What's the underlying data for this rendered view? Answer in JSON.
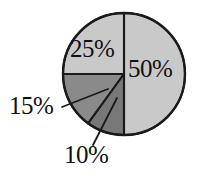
{
  "figure": {
    "background_color": "#ffffff",
    "width": 200,
    "height": 181
  },
  "chart_data": {
    "type": "pie",
    "title": "",
    "subtitle": "",
    "xlabel": "",
    "ylabel": "",
    "legend": "none",
    "grid": false,
    "start_angle_deg": 0,
    "direction": "clockwise",
    "center": {
      "x": 124,
      "y": 74
    },
    "radius": 61,
    "labels": [
      "50%",
      "25%",
      "15%",
      "10%"
    ],
    "values": [
      50,
      25,
      15,
      10
    ],
    "categories": [
      "50%",
      "25%",
      "15%",
      "10%"
    ],
    "slices": [
      {
        "label": "50%",
        "value": 50,
        "start_angle_deg": 0,
        "end_angle_deg": 180,
        "color": "#c9c9c9",
        "edge_color": "#1a1a1a",
        "label_position": "inside"
      },
      {
        "label": "25%",
        "value": 25,
        "start_angle_deg": 270,
        "end_angle_deg": 360,
        "color": "#c9c9c9",
        "edge_color": "#1a1a1a",
        "label_position": "inside"
      },
      {
        "label": "15%",
        "value": 15,
        "start_angle_deg": 216,
        "end_angle_deg": 270,
        "color": "#8a8a8a",
        "edge_color": "#1a1a1a",
        "label_position": "outside-left",
        "leader_line": true
      },
      {
        "label": "10%",
        "value": 10,
        "start_angle_deg": 180,
        "end_angle_deg": 216,
        "color": "#787878",
        "edge_color": "#1a1a1a",
        "label_position": "outside-bottom",
        "leader_line": true
      }
    ],
    "colors": {
      "outline": "#1a1a1a",
      "light_gray": "#c9c9c9",
      "medium_gray": "#8a8a8a",
      "dark_gray": "#787878",
      "text": "#111111",
      "background": "#ffffff"
    }
  }
}
